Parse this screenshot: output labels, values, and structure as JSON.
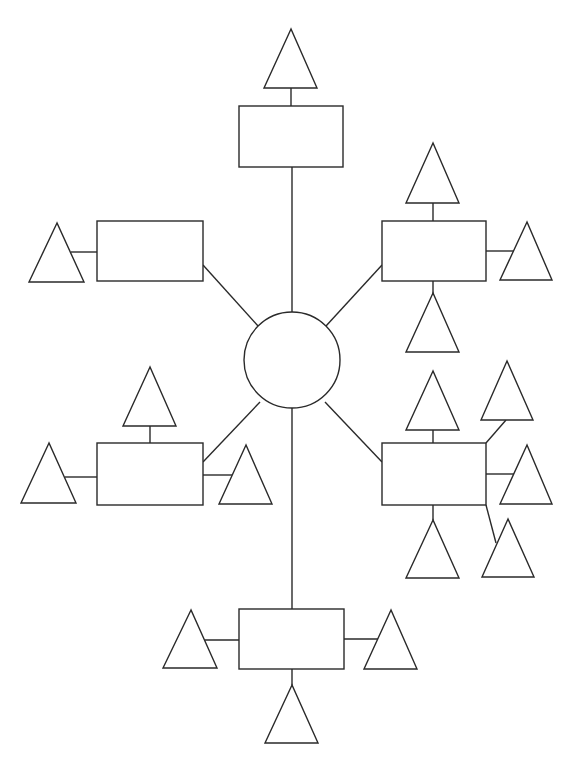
{
  "diagram": {
    "type": "mind-map-template",
    "center": {
      "shape": "circle",
      "label": ""
    },
    "branches": [
      {
        "id": "top",
        "label": "",
        "leaves": [
          {
            "side": "top",
            "label": ""
          }
        ]
      },
      {
        "id": "upper-left",
        "label": "",
        "leaves": [
          {
            "side": "left",
            "label": ""
          }
        ]
      },
      {
        "id": "upper-right",
        "label": "",
        "leaves": [
          {
            "side": "top",
            "label": ""
          },
          {
            "side": "right",
            "label": ""
          },
          {
            "side": "bottom",
            "label": ""
          }
        ]
      },
      {
        "id": "lower-left",
        "label": "",
        "leaves": [
          {
            "side": "top",
            "label": ""
          },
          {
            "side": "left",
            "label": ""
          },
          {
            "side": "right",
            "label": ""
          }
        ]
      },
      {
        "id": "lower-right",
        "label": "",
        "leaves": [
          {
            "side": "top",
            "label": ""
          },
          {
            "side": "top-right",
            "label": ""
          },
          {
            "side": "right",
            "label": ""
          },
          {
            "side": "bottom",
            "label": ""
          },
          {
            "side": "bottom-right",
            "label": ""
          }
        ]
      },
      {
        "id": "bottom",
        "label": "",
        "leaves": [
          {
            "side": "left",
            "label": ""
          },
          {
            "side": "right",
            "label": ""
          },
          {
            "side": "bottom",
            "label": ""
          }
        ]
      }
    ],
    "stroke_color": "#2a2a2a",
    "background_color": "#ffffff"
  }
}
